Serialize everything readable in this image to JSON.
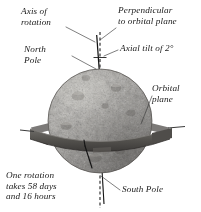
{
  "figure": {
    "background_color": "#ffffff",
    "text_color": "#1a1a1a"
  },
  "labels": {
    "axis_of_rotation": "Axis of\nrotation",
    "perpendicular": "Perpendicular\nto orbital plane",
    "axial_tilt": "Axial tilt of 2°",
    "north_pole": "North\nPole",
    "orbital_plane": "Orbital\nplane",
    "rotation_period": "One rotation\ntakes 58 days\nand 16 hours",
    "south_pole": "South Pole"
  },
  "planet": {
    "name": "planet-sphere",
    "center_x": 100,
    "center_y": 121,
    "radius": 52,
    "surface": "heavily cratered gray rock",
    "base_color": "#9a9792",
    "shadow_color": "#6d6a66",
    "highlight_color": "#c9c6c0"
  },
  "orbital_ring": {
    "name": "orbital-plane-band",
    "color": "#5c5a57",
    "edge_color": "#3f3d3b",
    "center_y": 131,
    "half_width": 68,
    "band_thickness": 13,
    "left_line_x": 20,
    "right_line_x": 183
  },
  "axis": {
    "name": "rotation-axis",
    "color": "#141414",
    "tilt_degrees": 2,
    "top_x": 97,
    "top_y": 36,
    "bottom_x": 103,
    "bottom_y": 205
  },
  "perpendicular_line": {
    "name": "perpendicular-dashed-line",
    "color": "#2a2a2a",
    "x": 100,
    "top_y": 32,
    "bottom_y": 207,
    "dash_pattern": "3,2.4"
  },
  "leaders": {
    "color": "#3a3a3a",
    "stroke_width": 0.65
  },
  "tilt_tick": {
    "name": "axial-tilt-tick",
    "x1": 94,
    "x2": 106,
    "y": 57
  }
}
